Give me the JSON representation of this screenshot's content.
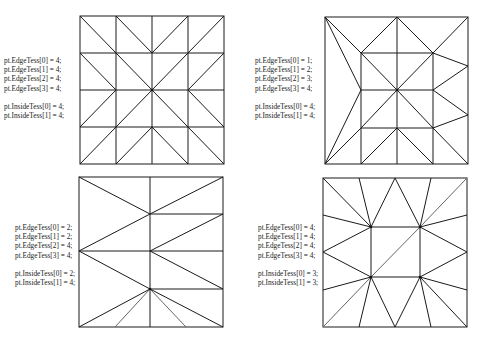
{
  "panels": [
    {
      "id": "top-left",
      "labels": {
        "edge0": "pt.EdgeTess[0] = 4;",
        "edge1": "pt.EdgeTess[1] = 4;",
        "edge2": "pt.EdgeTess[2] = 4;",
        "edge3": "pt.EdgeTess[3] = 4;",
        "inside0": "pt.InsideTess[0] = 4;",
        "inside1": "pt.InsideTess[1] = 4;"
      }
    },
    {
      "id": "top-right",
      "labels": {
        "edge0": "pt.EdgeTess[0] = 1;",
        "edge1": "pt.EdgeTess[1] = 2;",
        "edge2": "pt.EdgeTess[2] = 3;",
        "edge3": "pt.EdgeTess[3] = 4;",
        "inside0": "pt.InsideTess[0] = 4;",
        "inside1": "pt.InsideTess[1] = 4;"
      }
    },
    {
      "id": "bottom-left",
      "labels": {
        "edge0": "pt.EdgeTess[0] = 2;",
        "edge1": "pt.EdgeTess[1] = 2;",
        "edge2": "pt.EdgeTess[2] = 4;",
        "edge3": "pt.EdgeTess[3] = 4;",
        "inside0": "pt.InsideTess[0] = 2;",
        "inside1": "pt.InsideTess[1] = 4;"
      }
    },
    {
      "id": "bottom-right",
      "labels": {
        "edge0": "pt.EdgeTess[0] = 4;",
        "edge1": "pt.EdgeTess[1] = 4;",
        "edge2": "pt.EdgeTess[2] = 4;",
        "edge3": "pt.EdgeTess[3] = 4;",
        "inside0": "pt.InsideTess[0] = 3;",
        "inside1": "pt.InsideTess[1] = 3;"
      }
    }
  ],
  "colors": {
    "stroke": "#1a1a1a",
    "background": "#ffffff",
    "text": "#222222"
  }
}
